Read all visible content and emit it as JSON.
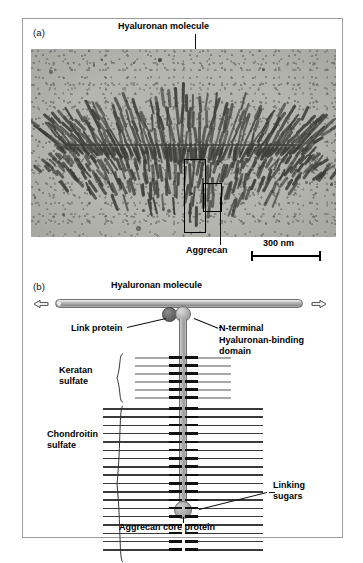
{
  "figure": {
    "panel_a": {
      "letter": "(a)",
      "title_label": "Hyaluronan molecule",
      "aggrecan_label": "Aggrecan",
      "scale_bar_label": "300 nm",
      "image_type": "electron-micrograph",
      "description": "Electron micrograph of a hyaluronan molecule with many aggrecan proteoglycans radiating from the central filament"
    },
    "panel_b": {
      "letter": "(b)",
      "hyaluronan_label": "Hyaluronan molecule",
      "link_protein_label": "Link protein",
      "nterminal_label": "N-terminal\nHyaluronan-binding\ndomain",
      "nterminal_line1": "N-terminal",
      "nterminal_line2": "Hyaluronan-binding",
      "nterminal_line3": "domain",
      "keratan_line1": "Keratan",
      "keratan_line2": "sulfate",
      "chondroitin_line1": "Chondroitin",
      "chondroitin_line2": "sulfate",
      "linking_line1": "Linking",
      "linking_line2": "sugars",
      "core_protein_label": "Aggrecan core protein"
    }
  },
  "colors": {
    "micrograph_background": "#b9b9b4",
    "filament": "#3b3b39",
    "link_protein_sphere": "#5b5b5b",
    "nterminal_sphere": "#b4b4b4",
    "core_protein": "#a8a8a8",
    "keratan_sulfate_line": "#a8a8a8",
    "chondroitin_sulfate_line": "#3a3a3a",
    "linking_sugar_stub": "#111111",
    "figure_border": "#9b9b9b"
  },
  "chart_data": {
    "type": "diagram",
    "keratan_sulfate_chain_count": 6,
    "chondroitin_sulfate_chain_count": 18,
    "keratan_sulfate_chain_halfwidth_px": 48,
    "chondroitin_sulfate_chain_halfwidth_px": 80,
    "components": [
      "Hyaluronan molecule",
      "Link protein",
      "N-terminal Hyaluronan-binding domain",
      "Aggrecan core protein",
      "Keratan sulfate",
      "Chondroitin sulfate",
      "Linking sugars"
    ]
  }
}
